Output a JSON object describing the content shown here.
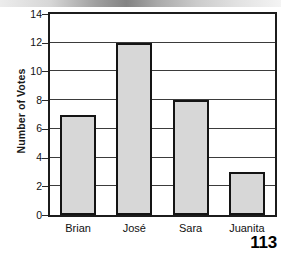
{
  "page": {
    "page_number": "113"
  },
  "chart_data": {
    "type": "bar",
    "title": "",
    "xlabel": "",
    "ylabel": "Number of Votes",
    "categories": [
      "Brian",
      "José",
      "Sara",
      "Juanita"
    ],
    "values": [
      7,
      12,
      8,
      3
    ],
    "series": [
      {
        "name": "Number of Votes",
        "values": [
          7,
          12,
          8,
          3
        ]
      }
    ],
    "ylim": [
      0,
      14
    ],
    "ytick_interval": 2,
    "yticks": [
      0,
      2,
      4,
      6,
      8,
      10,
      12,
      14
    ],
    "ytick_labels": [
      "0",
      "2",
      "4",
      "6",
      "8",
      "10",
      "12",
      "14"
    ],
    "grid": "horizontal",
    "legend": "none",
    "bar_fill_color": "#d7d7d7",
    "bar_edge_color": "#141414",
    "axis_color": "#1c1c1c",
    "gridline_color": "#3b3b3b",
    "background_color": "#ffffff"
  }
}
